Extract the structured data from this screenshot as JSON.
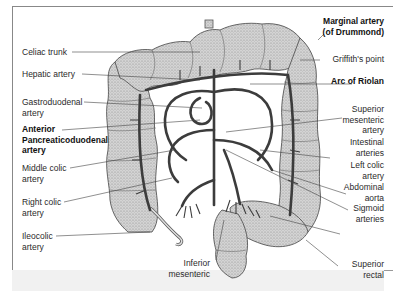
{
  "figure": {
    "left_labels": [
      {
        "id": "celiac-trunk",
        "lines": [
          "Celiac trunk"
        ],
        "bold": false
      },
      {
        "id": "hepatic-artery",
        "lines": [
          "Hepatic artery"
        ],
        "bold": false
      },
      {
        "id": "gastroduodenal-artery",
        "lines": [
          "Gastroduodenal",
          "artery"
        ],
        "bold": false
      },
      {
        "id": "anterior-pancreaticoduodenal-artery",
        "lines": [
          "Anterior",
          "Pancreaticoduodenal",
          "artery"
        ],
        "bold": true
      },
      {
        "id": "middle-colic-artery",
        "lines": [
          "Middle colic",
          "artery"
        ],
        "bold": false
      },
      {
        "id": "right-colic-artery",
        "lines": [
          "Right colic",
          "artery"
        ],
        "bold": false
      },
      {
        "id": "ileocolic-artery",
        "lines": [
          "Ileocolic",
          "artery"
        ],
        "bold": false
      }
    ],
    "right_labels": [
      {
        "id": "marginal-artery",
        "lines": [
          "Marginal artery",
          "(of Drummond)"
        ],
        "bold": true
      },
      {
        "id": "griffiths-point",
        "lines": [
          "Griffith's point"
        ],
        "bold": false
      },
      {
        "id": "arc-of-riolan",
        "lines": [
          "Arc of Riolan"
        ],
        "bold": true
      },
      {
        "id": "superior-mesenteric-artery",
        "lines": [
          "Superior",
          "mesenteric",
          "artery"
        ],
        "bold": false
      },
      {
        "id": "intestinal-arteries",
        "lines": [
          "Intestinal",
          "arteries"
        ],
        "bold": false
      },
      {
        "id": "left-colic-artery",
        "lines": [
          "Left colic",
          "artery"
        ],
        "bold": false
      },
      {
        "id": "abdominal-aorta",
        "lines": [
          "Abdominal",
          "aorta"
        ],
        "bold": false
      },
      {
        "id": "sigmoid-arteries",
        "lines": [
          "Sigmoid",
          "arteries"
        ],
        "bold": false
      },
      {
        "id": "superior-rectal",
        "lines": [
          "Superior",
          "rectal"
        ],
        "bold": false
      }
    ],
    "bottom_labels": [
      {
        "id": "inferior-mesenteric",
        "lines": [
          "Inferior",
          "mesenteric"
        ],
        "bold": false
      }
    ]
  }
}
